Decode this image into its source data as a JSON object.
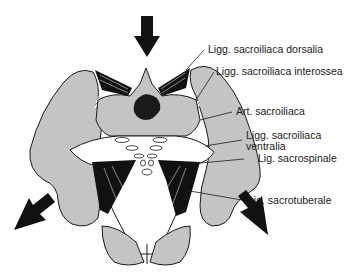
{
  "diagram": {
    "labels": [
      {
        "id": "ligg-sacroiliaca-dorsalia",
        "text": "Ligg. sacroiliaca dorsalia"
      },
      {
        "id": "ligg-sacroiliaca-interossea",
        "text": "Ligg. sacroiliaca interossea"
      },
      {
        "id": "art-sacroiliaca",
        "text": "Art. sacroiliaca"
      },
      {
        "id": "ligg-sacroiliaca-ventralia-1",
        "text": "Ligg. sacroiliaca"
      },
      {
        "id": "ligg-sacroiliaca-ventralia-2",
        "text": "ventralia"
      },
      {
        "id": "lig-sacrospinale",
        "text": "Lig. sacrospinale"
      },
      {
        "id": "lig-sacrotuberale",
        "text": "Lig. sacrotuberale"
      }
    ],
    "arrows": [
      "top-down",
      "bottom-left-upward",
      "bottom-right-upward"
    ],
    "colors": {
      "bone": "#c4c4c4",
      "outline": "#1a1a1a",
      "ligament": "#111111",
      "background": "#ffffff"
    }
  }
}
